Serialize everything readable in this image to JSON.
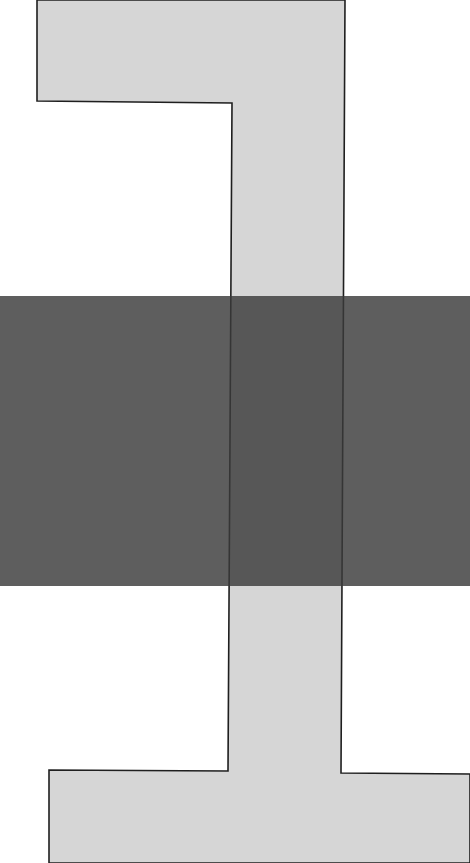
{
  "canvas": {
    "width": 470,
    "height": 863,
    "background": "#ffffff"
  },
  "shape": {
    "name": "light-gray-stepped-column",
    "fill": "#d6d6d6",
    "stroke": "#1f1f1f",
    "stroke_width": 1.6,
    "points": [
      [
        37,
        0
      ],
      [
        345,
        0
      ],
      [
        341,
        773
      ],
      [
        470,
        774
      ],
      [
        470,
        863
      ],
      [
        49,
        863
      ],
      [
        49,
        770
      ],
      [
        228,
        771
      ],
      [
        232,
        103
      ],
      [
        37,
        101
      ]
    ]
  },
  "band": {
    "name": "dark-horizontal-band",
    "x": 0,
    "y": 296,
    "width": 470,
    "height": 290,
    "fill": "#3a3a3a",
    "opacity": 0.82
  }
}
